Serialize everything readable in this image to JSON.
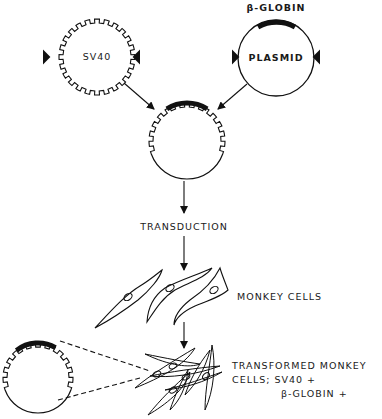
{
  "labels": {
    "sv40": "SV40",
    "plasmid": "PLASMID",
    "beta_globin_top": "β-GLOBIN",
    "transduction": "TRANSDUCTION",
    "monkey_cells": "MONKEY CELLS",
    "transformed_line1": "TRANSFORMED MONKEY",
    "transformed_line2": "CELLS; SV40 +",
    "transformed_line3": "β-GLOBIN +"
  },
  "colors": {
    "ink": "#111111",
    "background": "#ffffff"
  },
  "nodes": [
    {
      "id": "sv40-genome",
      "shape": "toothed-circle",
      "label": "SV40"
    },
    {
      "id": "globin-plasmid",
      "shape": "circle-with-insert",
      "label": "PLASMID",
      "insert": "β-GLOBIN"
    },
    {
      "id": "recombinant-vector",
      "shape": "hybrid-circle"
    },
    {
      "id": "monkey-cells",
      "shape": "cells",
      "label": "MONKEY CELLS"
    },
    {
      "id": "transformed-cells",
      "shape": "tangled-cells",
      "label": "TRANSFORMED MONKEY CELLS; SV40 + β-GLOBIN +"
    }
  ],
  "edges": [
    {
      "from": "sv40-genome",
      "to": "recombinant-vector"
    },
    {
      "from": "globin-plasmid",
      "to": "recombinant-vector"
    },
    {
      "from": "recombinant-vector",
      "to": "monkey-cells",
      "label": "TRANSDUCTION"
    },
    {
      "from": "monkey-cells",
      "to": "transformed-cells"
    }
  ]
}
